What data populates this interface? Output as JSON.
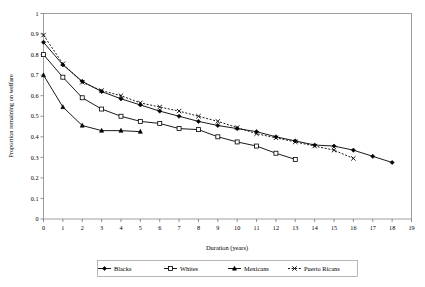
{
  "chart_data": {
    "type": "line",
    "title": "",
    "xlabel": "Duration (years)",
    "ylabel": "Proportion remaining on welfare",
    "xlim": [
      0,
      19
    ],
    "ylim": [
      0,
      1
    ],
    "xticks": [
      0,
      1,
      2,
      3,
      4,
      5,
      6,
      7,
      8,
      9,
      10,
      11,
      12,
      13,
      14,
      15,
      16,
      17,
      18,
      19
    ],
    "yticks": [
      0,
      0.1,
      0.2,
      0.3,
      0.4,
      0.5,
      0.6,
      0.7,
      0.8,
      0.9,
      1
    ],
    "ytick_labels": [
      "0",
      "0.1",
      "0.2",
      "0.3",
      "0.4",
      "0.5",
      "0.6",
      "0.7",
      "0.8",
      "0.9",
      "1"
    ],
    "xtick_labels": [
      "0",
      "1",
      "2",
      "3",
      "4",
      "5",
      "6",
      "7",
      "8",
      "9",
      "10",
      "11",
      "12",
      "13",
      "14",
      "15",
      "16",
      "17",
      "18",
      "19"
    ],
    "grid": false,
    "legend_position": "bottom",
    "series": [
      {
        "name": "Blacks",
        "marker": "filled-diamond",
        "line_style": "solid",
        "color": "#000000",
        "x": [
          0,
          1,
          2,
          3,
          4,
          5,
          6,
          7,
          8,
          9,
          10,
          11,
          12,
          13,
          14,
          15,
          16,
          17,
          18
        ],
        "values": [
          0.86,
          0.75,
          0.67,
          0.62,
          0.585,
          0.555,
          0.525,
          0.5,
          0.475,
          0.455,
          0.44,
          0.425,
          0.4,
          0.38,
          0.36,
          0.355,
          0.335,
          0.305,
          0.275
        ]
      },
      {
        "name": "Whites",
        "marker": "open-square",
        "line_style": "solid",
        "color": "#000000",
        "x": [
          0,
          1,
          2,
          3,
          4,
          5,
          6,
          7,
          8,
          9,
          10,
          11,
          12,
          13
        ],
        "values": [
          0.8,
          0.69,
          0.59,
          0.535,
          0.5,
          0.475,
          0.465,
          0.44,
          0.435,
          0.4,
          0.375,
          0.355,
          0.32,
          0.29
        ]
      },
      {
        "name": "Mexicans",
        "marker": "filled-triangle",
        "line_style": "solid",
        "color": "#000000",
        "x": [
          0,
          1,
          2,
          3,
          4,
          5
        ],
        "values": [
          0.7,
          0.545,
          0.455,
          0.43,
          0.43,
          0.425
        ]
      },
      {
        "name": "Puerto Ricans",
        "marker": "x-star",
        "line_style": "dotted",
        "color": "#000000",
        "x": [
          0,
          1,
          2,
          3,
          4,
          5,
          6,
          7,
          8,
          9,
          10,
          11,
          12,
          13,
          14,
          15,
          16
        ],
        "values": [
          0.895,
          0.755,
          0.665,
          0.625,
          0.6,
          0.565,
          0.545,
          0.525,
          0.5,
          0.475,
          0.445,
          0.415,
          0.395,
          0.375,
          0.355,
          0.335,
          0.295
        ]
      }
    ]
  },
  "legend": {
    "items": [
      {
        "label": "Blacks",
        "marker": "filled-diamond",
        "style": "solid"
      },
      {
        "label": "Whites",
        "marker": "open-square",
        "style": "solid"
      },
      {
        "label": "Mexicans",
        "marker": "filled-triangle",
        "style": "solid"
      },
      {
        "label": "Puerto Ricans",
        "marker": "x-star",
        "style": "dotted"
      }
    ]
  }
}
